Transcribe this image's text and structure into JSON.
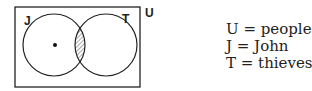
{
  "diagram": {
    "universe_label": "U",
    "left_label": "J",
    "right_label": "T",
    "shaded_region": "intersection of J and T",
    "point": "inside J only"
  },
  "legend": [
    {
      "text": "U = people"
    },
    {
      "text": "J = John"
    },
    {
      "text": "T = thieves"
    }
  ]
}
